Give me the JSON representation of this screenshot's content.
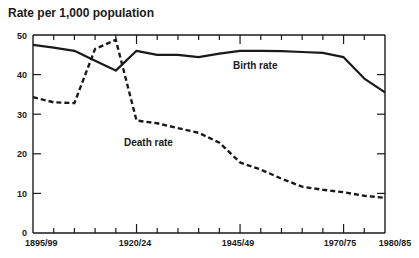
{
  "chart_data": {
    "type": "line",
    "title": "Rate per 1,000 population",
    "xlabel": "",
    "ylabel": "Rate per 1,000 population",
    "ylim": [
      0,
      50
    ],
    "yticks": [
      0,
      10,
      20,
      30,
      40,
      50
    ],
    "x_tick_labels": [
      "1895/99",
      "1920/24",
      "1945/49",
      "1970/75",
      "1980/85"
    ],
    "x": [
      "1895/99",
      "1900/04",
      "1905/09",
      "1910/14",
      "1915/19",
      "1920/24",
      "1925/29",
      "1930/34",
      "1935/39",
      "1940/44",
      "1945/49",
      "1950/54",
      "1955/59",
      "1960/64",
      "1965/69",
      "1970/75",
      "1975/79",
      "1980/85"
    ],
    "series": [
      {
        "name": "Birth rate",
        "style": "solid",
        "values": [
          47.5,
          46.8,
          46.0,
          43.5,
          41.0,
          46.0,
          45.0,
          45.0,
          44.4,
          45.3,
          46.0,
          46.0,
          45.9,
          45.7,
          45.5,
          44.4,
          39.0,
          35.5
        ]
      },
      {
        "name": "Death rate",
        "style": "dashed",
        "values": [
          34.3,
          33.0,
          32.8,
          46.5,
          48.8,
          28.4,
          27.7,
          26.5,
          25.3,
          22.8,
          17.8,
          16.0,
          13.7,
          11.7,
          10.9,
          10.3,
          9.4,
          8.9
        ]
      }
    ],
    "grid": false,
    "legend": "inline labels",
    "annotations": [
      {
        "text": "Birth rate",
        "near": "1950/54-1955/59, ~43"
      },
      {
        "text": "Death rate",
        "near": "1925/29, ~22"
      }
    ]
  },
  "labels": {
    "title": "Rate per 1,000 population",
    "birth": "Birth rate",
    "death": "Death rate",
    "y0": "0",
    "y10": "10",
    "y20": "20",
    "y30": "30",
    "y40": "40",
    "y50": "50",
    "x0": "1895/99",
    "x1": "1920/24",
    "x2": "1945/49",
    "x3": "1970/75",
    "x4": "1980/85"
  }
}
